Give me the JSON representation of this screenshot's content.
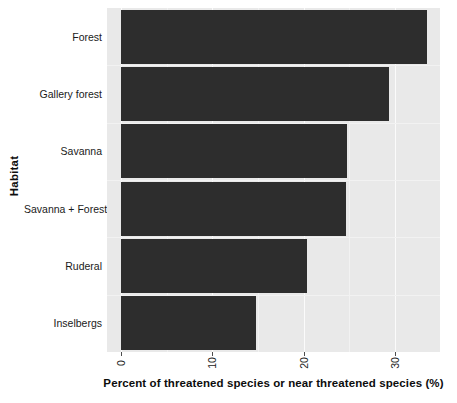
{
  "chart_data": {
    "type": "bar",
    "orientation": "horizontal",
    "title": "",
    "xlabel": "Percent of threatened species or near threatened species (%)",
    "ylabel": "Habitat",
    "categories": [
      "Forest",
      "Gallery forest",
      "Savanna",
      "Savanna + Forest",
      "Ruderal",
      "Inselbergs"
    ],
    "values": [
      33.5,
      29.3,
      24.8,
      24.6,
      20.4,
      14.8
    ],
    "xlim": [
      0,
      36.5
    ],
    "xticks": [
      0,
      10,
      20,
      30
    ],
    "xtick_labels": [
      "0",
      "10",
      "20",
      "30"
    ],
    "xtick_label_rotation": -90,
    "grid": true,
    "legend": false,
    "bar_color": "#2d2d2d",
    "panel_background": "#e9e9e9",
    "gridline_color": "#fbfbfb"
  },
  "axes": {
    "y_title": "Habitat",
    "x_title": "Percent of threatened species or near threatened species (%)"
  }
}
